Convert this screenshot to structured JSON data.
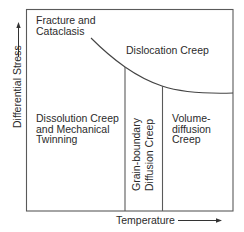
{
  "diagram": {
    "axes": {
      "x_label": "Temperature",
      "y_label": "Differential Stress"
    },
    "regions": {
      "fracture": {
        "line1": "Fracture and",
        "line2": "Cataclasis"
      },
      "dislocation": {
        "label": "Dislocation Creep"
      },
      "dissolution": {
        "line1": "Dissolution Creep",
        "line2": "and Mechanical",
        "line3": "Twinning"
      },
      "grain_boundary": {
        "line1": "Grain-boundary",
        "line2": "Diffusion Creep"
      },
      "volume_diffusion": {
        "line1": "Volume-",
        "line2": "diffusion",
        "line3": "Creep"
      }
    },
    "colors": {
      "line": "#555555",
      "text": "#2b2b2b",
      "background": "#ffffff"
    }
  }
}
